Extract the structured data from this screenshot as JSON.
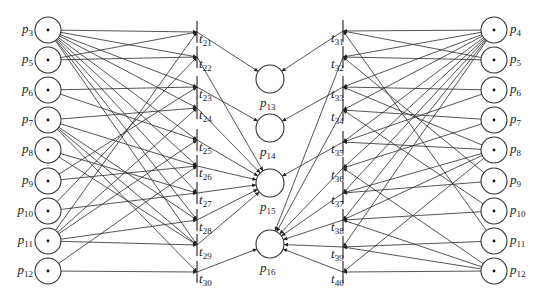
{
  "diagram": {
    "type": "petri-net",
    "colors": {
      "stroke": "#2a2a2a",
      "background": "#ffffff"
    },
    "left_places": [
      {
        "id": "p3",
        "label": "p",
        "sub": "3",
        "y": 30,
        "token": true
      },
      {
        "id": "p5",
        "label": "p",
        "sub": "5",
        "y": 60,
        "token": true
      },
      {
        "id": "p6",
        "label": "p",
        "sub": "6",
        "y": 90,
        "token": true
      },
      {
        "id": "p7",
        "label": "p",
        "sub": "7",
        "y": 120,
        "token": true
      },
      {
        "id": "p8",
        "label": "p",
        "sub": "8",
        "y": 150,
        "token": true
      },
      {
        "id": "p9",
        "label": "p",
        "sub": "9",
        "y": 181,
        "token": true
      },
      {
        "id": "p10",
        "label": "p",
        "sub": "10",
        "y": 211,
        "token": true
      },
      {
        "id": "p11",
        "label": "p",
        "sub": "11",
        "y": 241,
        "token": true
      },
      {
        "id": "p12",
        "label": "p",
        "sub": "12",
        "y": 271,
        "token": true
      }
    ],
    "right_places": [
      {
        "id": "p4r",
        "label": "p",
        "sub": "4",
        "y": 30,
        "token": true
      },
      {
        "id": "p5r",
        "label": "p",
        "sub": "5",
        "y": 60,
        "token": true
      },
      {
        "id": "p6r",
        "label": "p",
        "sub": "6",
        "y": 90,
        "token": true
      },
      {
        "id": "p7r",
        "label": "p",
        "sub": "7",
        "y": 120,
        "token": true
      },
      {
        "id": "p8r",
        "label": "p",
        "sub": "8",
        "y": 150,
        "token": true
      },
      {
        "id": "p9r",
        "label": "p",
        "sub": "9",
        "y": 181,
        "token": true
      },
      {
        "id": "p10r",
        "label": "p",
        "sub": "10",
        "y": 211,
        "token": true
      },
      {
        "id": "p11r",
        "label": "p",
        "sub": "11",
        "y": 241,
        "token": true
      },
      {
        "id": "p12r",
        "label": "p",
        "sub": "12",
        "y": 271,
        "token": true
      }
    ],
    "middle_places": [
      {
        "id": "p13",
        "label": "p",
        "sub": "13",
        "y": 79
      },
      {
        "id": "p14",
        "label": "p",
        "sub": "14",
        "y": 128
      },
      {
        "id": "p15",
        "label": "p",
        "sub": "15",
        "y": 183
      },
      {
        "id": "p16",
        "label": "p",
        "sub": "16",
        "y": 244
      }
    ],
    "left_transitions": [
      {
        "id": "t21",
        "label": "t",
        "sub": "21",
        "y": 32,
        "out": "p13"
      },
      {
        "id": "t22",
        "label": "t",
        "sub": "22",
        "y": 57,
        "out": "p15"
      },
      {
        "id": "t23",
        "label": "t",
        "sub": "23",
        "y": 87,
        "out": "p14"
      },
      {
        "id": "t24",
        "label": "t",
        "sub": "24",
        "y": 108,
        "out": "p15"
      },
      {
        "id": "t25",
        "label": "t",
        "sub": "25",
        "y": 140,
        "out": "p15"
      },
      {
        "id": "t26",
        "label": "t",
        "sub": "26",
        "y": 166,
        "out": "p15"
      },
      {
        "id": "t27",
        "label": "t",
        "sub": "27",
        "y": 193,
        "out": "p15"
      },
      {
        "id": "t28",
        "label": "t",
        "sub": "28",
        "y": 220,
        "out": "p15"
      },
      {
        "id": "t29",
        "label": "t",
        "sub": "29",
        "y": 245,
        "out": "p15"
      },
      {
        "id": "t30",
        "label": "t",
        "sub": "30",
        "y": 272,
        "out": "p16"
      }
    ],
    "right_transitions": [
      {
        "id": "t31",
        "label": "t",
        "sub": "31",
        "y": 31,
        "out": "p13"
      },
      {
        "id": "t32",
        "label": "t",
        "sub": "32",
        "y": 57,
        "out": "p16"
      },
      {
        "id": "t33",
        "label": "t",
        "sub": "33",
        "y": 87,
        "out": "p14"
      },
      {
        "id": "t34",
        "label": "t",
        "sub": "34",
        "y": 110,
        "out": "p16"
      },
      {
        "id": "t35",
        "label": "t",
        "sub": "35",
        "y": 142,
        "out": "p15"
      },
      {
        "id": "t36",
        "label": "t",
        "sub": "36",
        "y": 168,
        "out": "p16"
      },
      {
        "id": "t37",
        "label": "t",
        "sub": "37",
        "y": 193,
        "out": "p16"
      },
      {
        "id": "t38",
        "label": "t",
        "sub": "38",
        "y": 220,
        "out": "p16"
      },
      {
        "id": "t39",
        "label": "t",
        "sub": "39",
        "y": 247,
        "out": "p16"
      },
      {
        "id": "t40",
        "label": "t",
        "sub": "40",
        "y": 272,
        "out": "p16"
      }
    ],
    "left_arcs": [
      [
        "p3",
        "t21"
      ],
      [
        "p3",
        "t22"
      ],
      [
        "p3",
        "t23"
      ],
      [
        "p3",
        "t24"
      ],
      [
        "p3",
        "t25"
      ],
      [
        "p3",
        "t26"
      ],
      [
        "p3",
        "t27"
      ],
      [
        "p3",
        "t28"
      ],
      [
        "p3",
        "t29"
      ],
      [
        "p5",
        "t22"
      ],
      [
        "p5",
        "t21"
      ],
      [
        "p6",
        "t23"
      ],
      [
        "p6",
        "t25"
      ],
      [
        "p7",
        "t24"
      ],
      [
        "p7",
        "t26"
      ],
      [
        "p7",
        "t28"
      ],
      [
        "p7",
        "t29"
      ],
      [
        "p7",
        "t30"
      ],
      [
        "p8",
        "t27"
      ],
      [
        "p8",
        "t29"
      ],
      [
        "p9",
        "t23"
      ],
      [
        "p9",
        "t26"
      ],
      [
        "p10",
        "t22"
      ],
      [
        "p10",
        "t27"
      ],
      [
        "p11",
        "t21"
      ],
      [
        "p11",
        "t24"
      ],
      [
        "p11",
        "t25"
      ],
      [
        "p11",
        "t28"
      ],
      [
        "p11",
        "t29"
      ],
      [
        "p12",
        "t26"
      ],
      [
        "p12",
        "t30"
      ]
    ],
    "right_arcs": [
      [
        "p4r",
        "t31"
      ],
      [
        "p4r",
        "t32"
      ],
      [
        "p4r",
        "t33"
      ],
      [
        "p4r",
        "t34"
      ],
      [
        "p4r",
        "t35"
      ],
      [
        "p4r",
        "t36"
      ],
      [
        "p4r",
        "t37"
      ],
      [
        "p4r",
        "t38"
      ],
      [
        "p4r",
        "t39"
      ],
      [
        "p5r",
        "t32"
      ],
      [
        "p5r",
        "t31"
      ],
      [
        "p6r",
        "t33"
      ],
      [
        "p6r",
        "t35"
      ],
      [
        "p7r",
        "t34"
      ],
      [
        "p7r",
        "t36"
      ],
      [
        "p8r",
        "t33"
      ],
      [
        "p8r",
        "t35"
      ],
      [
        "p8r",
        "t37"
      ],
      [
        "p8r",
        "t38"
      ],
      [
        "p8r",
        "t40"
      ],
      [
        "p9r",
        "t37"
      ],
      [
        "p9r",
        "t32"
      ],
      [
        "p10r",
        "t38"
      ],
      [
        "p10r",
        "t34"
      ],
      [
        "p11r",
        "t39"
      ],
      [
        "p11r",
        "t31"
      ],
      [
        "p12r",
        "t40"
      ],
      [
        "p12r",
        "t36"
      ],
      [
        "p12r",
        "t39"
      ],
      [
        "p12r",
        "t38"
      ]
    ]
  }
}
